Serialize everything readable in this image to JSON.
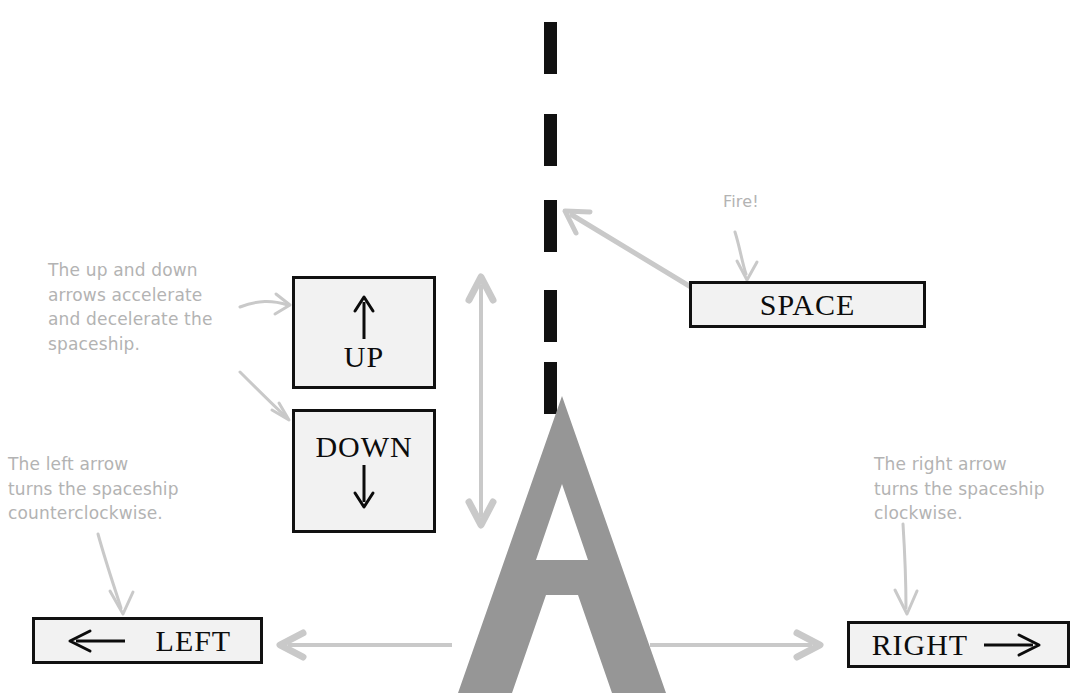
{
  "figure": {
    "background_color": "#ffffff",
    "ink_color": "#111111",
    "pencil_color": "#b3b3b3",
    "ship_color": "#969696",
    "key_fill": "#f2f2f2"
  },
  "keys": {
    "up": {
      "label": "UP",
      "arrow": "up-arrow-glyph",
      "arrow_position": "above-label"
    },
    "down": {
      "label": "DOWN",
      "arrow": "down-arrow-glyph",
      "arrow_position": "below-label"
    },
    "left": {
      "label": "LEFT",
      "arrow": "left-arrow-glyph",
      "arrow_position": "left-of-label"
    },
    "right": {
      "label": "RIGHT",
      "arrow": "right-arrow-glyph",
      "arrow_position": "right-of-label"
    },
    "space": {
      "label": "SPACE",
      "arrow": null,
      "arrow_position": null
    }
  },
  "annotations": {
    "updown": "The up and down\narrows accelerate\nand decelerate the\nspaceship.",
    "left": "The left arrow\nturns the spaceship\ncounterclockwise.",
    "right": "The right arrow\nturns the spaceship\nclockwise.",
    "fire": "Fire!"
  },
  "ship": {
    "name": "spaceship-letter-a",
    "glyph": "A"
  },
  "trajectory": {
    "name": "bullet-dashed-line",
    "dash_count": 5,
    "dash_color": "#111111"
  },
  "motion_arrows": {
    "vertical": {
      "name": "vertical-double-arrow",
      "direction": "both",
      "color": "#c9c9c9"
    },
    "horizontal_left": {
      "name": "horizontal-left-arrow",
      "direction": "left",
      "color": "#c9c9c9"
    },
    "horizontal_right": {
      "name": "horizontal-right-arrow",
      "direction": "right",
      "color": "#c9c9c9"
    }
  }
}
